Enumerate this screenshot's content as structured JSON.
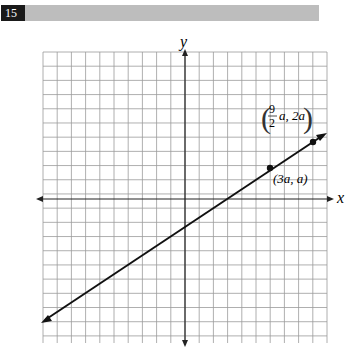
{
  "question": {
    "number": "15"
  },
  "chart_data": {
    "type": "line",
    "title": "",
    "xlabel": "x",
    "ylabel": "y",
    "grid": true,
    "grid_units_per_cell": 1,
    "x_cells": [
      -10,
      10
    ],
    "y_cells": [
      -10,
      10
    ],
    "line": {
      "slope": 0.6667,
      "y_intercept_cells": -2,
      "through": [
        "(3a, a)",
        "(9/2 a, 2a)"
      ],
      "arrows_both_ends": true
    },
    "points": [
      {
        "label": "(3a, a)",
        "x": "3a",
        "y": "a"
      },
      {
        "label": "(9/2 a, 2a)",
        "x": "9/2 a",
        "y": "2a"
      }
    ]
  },
  "labels": {
    "x_axis": "x",
    "y_axis": "y",
    "point1": "(3a, a)",
    "point2_frac_num": "9",
    "point2_frac_den": "2",
    "point2_rest": "a, 2a"
  }
}
